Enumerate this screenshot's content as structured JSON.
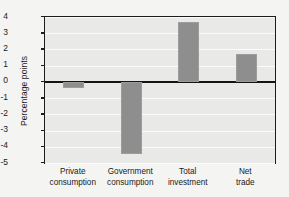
{
  "chart_data": {
    "type": "bar",
    "title": "",
    "subtitle": "",
    "xlabel": "",
    "ylabel": "Percentage points",
    "categories": [
      "Private\nconsumption",
      "Government\nconsumption",
      "Total\ninvestment",
      "Net\ntrade"
    ],
    "values": [
      -0.35,
      -4.45,
      3.7,
      1.75
    ],
    "ylim": [
      -5,
      4
    ],
    "yticks": [
      4,
      3,
      2,
      1,
      0,
      -1,
      -2,
      -3,
      -4,
      -5
    ],
    "ytick_labels": [
      "4",
      "3",
      "2",
      "1",
      "0",
      "-1",
      "-2",
      "-3",
      "-4",
      "-5"
    ],
    "grid": true,
    "legend": "none",
    "zero_line": 0,
    "colors": {
      "bar": "#8e8e8e",
      "plot_background": "#e9e9e7",
      "page_background": "#f4f4f2",
      "gridline": "#fbfbfa",
      "axis": "#1c1c1c",
      "text": "#1a1a1a"
    }
  }
}
